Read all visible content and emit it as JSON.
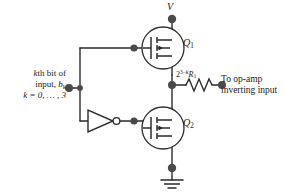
{
  "diagram": {
    "colors": {
      "wire": "#2b2b2b",
      "node": "#4a4a4a",
      "text": "#1a1a1a",
      "background": "#ffffff"
    }
  },
  "labels": {
    "supply": "V",
    "transistor_top": "Q",
    "transistor_top_sub": "1",
    "transistor_bottom": "Q",
    "transistor_bottom_sub": "2",
    "resistor_base": "2",
    "resistor_exponent": "3−k",
    "resistor_symbol": "R",
    "resistor_sub": "1",
    "output_line1": "To op-amp",
    "output_line2": "inverting input",
    "input_line1_a": "k",
    "input_line1_b": "th bit of",
    "input_line2_a": "input, ",
    "input_line2_b": "b",
    "input_line2_sub": "k",
    "input_line3": "k = 0, … , 3"
  },
  "components": [
    {
      "name": "supply-terminal",
      "type": "terminal"
    },
    {
      "name": "transistor-q1",
      "type": "mosfet"
    },
    {
      "name": "transistor-q2",
      "type": "mosfet"
    },
    {
      "name": "inverter-gate",
      "type": "not-gate"
    },
    {
      "name": "resistor-r1",
      "type": "resistor"
    },
    {
      "name": "ground-symbol",
      "type": "ground"
    },
    {
      "name": "input-terminal",
      "type": "terminal"
    },
    {
      "name": "output-terminal",
      "type": "terminal"
    }
  ]
}
